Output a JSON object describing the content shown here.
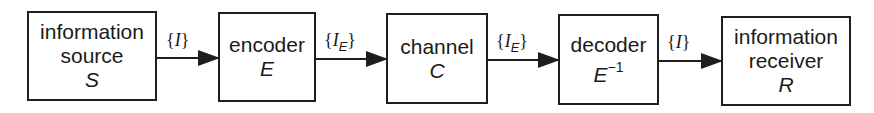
{
  "diagram": {
    "type": "block-flow",
    "direction": "left-to-right",
    "blocks": [
      {
        "id": "source",
        "lines": [
          "information",
          "source"
        ],
        "symbol": "S",
        "symbol_sup": ""
      },
      {
        "id": "encoder",
        "lines": [
          "encoder"
        ],
        "symbol": "E",
        "symbol_sup": ""
      },
      {
        "id": "channel",
        "lines": [
          "channel"
        ],
        "symbol": "C",
        "symbol_sup": ""
      },
      {
        "id": "decoder",
        "lines": [
          "decoder"
        ],
        "symbol": "E",
        "symbol_sup": "−1"
      },
      {
        "id": "receiver",
        "lines": [
          "information",
          "receiver"
        ],
        "symbol": "R",
        "symbol_sup": ""
      }
    ],
    "edges": [
      {
        "from": "source",
        "to": "encoder",
        "label_open": "{",
        "label_var": "I",
        "label_sub": "",
        "label_close": "}"
      },
      {
        "from": "encoder",
        "to": "channel",
        "label_open": "{",
        "label_var": "I",
        "label_sub": "E",
        "label_close": "}"
      },
      {
        "from": "channel",
        "to": "decoder",
        "label_open": "{",
        "label_var": "I",
        "label_sub": "E",
        "label_close": "}"
      },
      {
        "from": "decoder",
        "to": "receiver",
        "label_open": "{",
        "label_var": "I",
        "label_sub": "",
        "label_close": "}"
      }
    ]
  }
}
